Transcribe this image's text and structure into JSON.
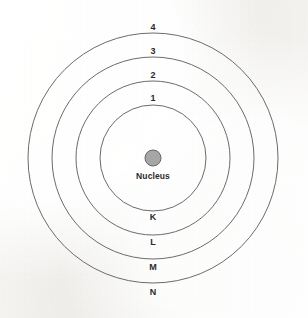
{
  "diagram": {
    "type": "concentric-shell-diagram",
    "background_color": "#f7f6f4",
    "ring_stroke_color": "#6b6b6b",
    "nucleus_fill_color": "#a6a6a6",
    "label_color": "#2b2b2b",
    "center": {
      "x": 153,
      "y": 158
    },
    "nucleus": {
      "label": "Nucleus",
      "radius": 8,
      "label_x": 153,
      "label_y": 172
    },
    "shells": [
      {
        "number_label": "1",
        "letter_label": "K",
        "radius": 53,
        "number_x": 153,
        "number_y": 94,
        "letter_x": 153,
        "letter_y": 213
      },
      {
        "number_label": "2",
        "letter_label": "L",
        "radius": 77,
        "number_x": 153,
        "number_y": 71,
        "letter_x": 153,
        "letter_y": 238
      },
      {
        "number_label": "3",
        "letter_label": "M",
        "radius": 101,
        "number_x": 153,
        "number_y": 47,
        "letter_x": 153,
        "letter_y": 263
      },
      {
        "number_label": "4",
        "letter_label": "N",
        "radius": 125,
        "number_x": 153,
        "number_y": 23,
        "letter_x": 153,
        "letter_y": 288
      }
    ]
  }
}
